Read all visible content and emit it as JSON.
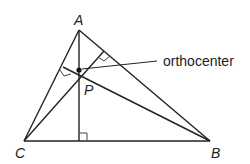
{
  "diagram": {
    "vertices": {
      "A": {
        "label": "A",
        "x": 79,
        "y": 30
      },
      "B": {
        "label": "B",
        "x": 210,
        "y": 141
      },
      "C": {
        "label": "C",
        "x": 24,
        "y": 141
      }
    },
    "orthocenter": {
      "label": "P",
      "x": 79,
      "y": 70
    },
    "annotation": {
      "text": "orthocenter"
    },
    "colors": {
      "stroke": "#222222",
      "background": "#ffffff"
    }
  }
}
